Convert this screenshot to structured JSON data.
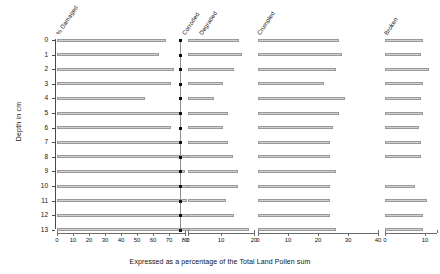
{
  "chart_data": {
    "type": "bar",
    "title": "",
    "xlabel": "Expressed as a percentage of the Total Land Pollen sum",
    "ylabel": "Depth in cm",
    "orientation": "horizontal",
    "grid": false,
    "legend": "none",
    "ylim": [
      0,
      13
    ],
    "y_tick_labels": [
      "0",
      "1",
      "2",
      "3",
      "4",
      "5",
      "6",
      "7",
      "8",
      "9",
      "10",
      "11",
      "12",
      "13"
    ],
    "depths": [
      0,
      1,
      2,
      3,
      4,
      5,
      6,
      7,
      8,
      9,
      10,
      11,
      12,
      13
    ],
    "series": [
      {
        "name": "% Damaged",
        "xlim": [
          0,
          80
        ],
        "x_tick_labels": [
          "0",
          "10",
          "20",
          "30",
          "40",
          "50",
          "60",
          "70",
          "80"
        ],
        "x_ticks": [
          0,
          10,
          20,
          30,
          40,
          50,
          60,
          70,
          80
        ],
        "values": [
          68,
          64,
          73,
          71,
          55,
          77,
          71,
          78,
          88,
          80,
          84,
          81,
          86,
          84
        ]
      },
      {
        "name": "Corroded",
        "xlim": [
          0,
          20
        ],
        "x_tick_labels": [
          "0",
          "10",
          "20"
        ],
        "x_ticks": [
          0,
          10,
          20
        ],
        "has_markers": true,
        "marker_values": [
          0,
          0,
          0,
          0,
          0,
          0,
          0,
          0,
          0,
          0,
          0,
          0,
          0,
          0
        ],
        "values": [
          15.5,
          16.5,
          14,
          10.5,
          8,
          12,
          10.5,
          12,
          13.5,
          15,
          15,
          11.5,
          14,
          18.5
        ]
      },
      {
        "name": "Crumpled",
        "xlim": [
          0,
          40
        ],
        "x_tick_labels": [
          "0",
          "10",
          "20",
          "30",
          "40"
        ],
        "x_ticks": [
          0,
          10,
          20,
          30,
          40
        ],
        "values": [
          27,
          28,
          26,
          22,
          29,
          27,
          25,
          24,
          24,
          26,
          24,
          24,
          24,
          26
        ]
      },
      {
        "name": "Broken",
        "xlim": [
          0,
          13
        ],
        "x_tick_labels": [
          "0",
          "10"
        ],
        "x_ticks": [
          0,
          10
        ],
        "values": [
          9.5,
          9.0,
          11.0,
          9.5,
          9.0,
          9.5,
          8.5,
          9.0,
          9.0,
          0,
          7.5,
          10.5,
          9.5,
          9.5,
          9.0
        ]
      }
    ]
  },
  "colors": {
    "axis": "#4a4a4a",
    "bar_fill": "#d8d8d8",
    "bar_stroke": "#9a9a9a",
    "marker": "#111111",
    "text": "#111111"
  }
}
